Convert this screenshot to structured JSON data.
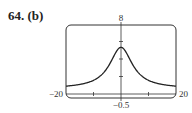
{
  "problem_label": "64. (b)",
  "chart_data": {
    "type": "line",
    "title": "",
    "xlabel": "",
    "ylabel": "",
    "xlim": [
      -20,
      20
    ],
    "ylim": [
      -0.5,
      8
    ],
    "x_tick_labels": {
      "left": "-20",
      "right": "20"
    },
    "y_tick_labels": {
      "top": "8",
      "bottom": "-0.5"
    },
    "x_ticks": [
      -10,
      0,
      10
    ],
    "y_ticks": [
      2,
      4,
      6
    ],
    "grid": false,
    "series": [
      {
        "name": "f(x)",
        "x": [
          -20,
          -15,
          -10,
          -6,
          -4,
          -2,
          0,
          2,
          4,
          6,
          10,
          15,
          20
        ],
        "values": [
          0.6,
          0.9,
          1.6,
          2.6,
          3.4,
          4.6,
          6.0,
          4.6,
          3.4,
          2.6,
          1.6,
          0.9,
          0.6
        ]
      }
    ]
  }
}
